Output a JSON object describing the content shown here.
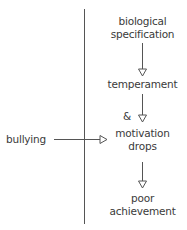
{
  "diagram": {
    "nodes": [
      {
        "id": "bio",
        "line1": "biological",
        "line2": "specification"
      },
      {
        "id": "temp",
        "label": "temperament"
      },
      {
        "id": "amp",
        "label": "&"
      },
      {
        "id": "motiv",
        "line1": "motivation",
        "line2": "drops"
      },
      {
        "id": "poor",
        "line1": "poor",
        "line2": "achievement"
      }
    ],
    "external": {
      "label": "bullying"
    },
    "edges": [
      {
        "from": "biological specification",
        "to": "temperament"
      },
      {
        "from": "temperament",
        "to": "motivation drops"
      },
      {
        "from": "bullying",
        "to": "motivation drops"
      },
      {
        "from": "motivation drops",
        "to": "poor achievement"
      }
    ]
  }
}
